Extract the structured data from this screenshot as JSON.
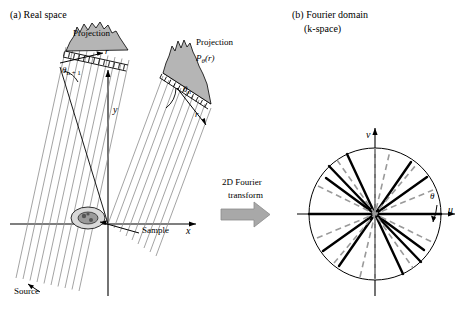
{
  "figure": {
    "panel_a": {
      "title": "(a) Real space",
      "labels": {
        "projection_left": "Projection",
        "projection_right": "Projection",
        "p_theta_r": "P",
        "p_theta_r_sub": "θ",
        "p_theta_r_tail": "(r)",
        "theta_n1": "θ",
        "theta_n1_sub": "n + 1",
        "theta_n": "θ",
        "theta_n_sub": "n",
        "r_left": "r",
        "r_right": "r",
        "axis_x": "x",
        "axis_y": "y",
        "sample": "Sample",
        "source": "Source"
      }
    },
    "panel_b": {
      "title_line1": "(b) Fourier domain",
      "title_line2": "(k-space)",
      "labels": {
        "axis_u": "u",
        "axis_v": "v",
        "theta": "θ"
      }
    },
    "center": {
      "arrow_label_line1": "2D Fourier",
      "arrow_label_line2": "transform"
    },
    "colors": {
      "stroke": "#000000",
      "fill_gray": "#b5b5b5",
      "line_gray": "#8c8c8c",
      "arrow_gray": "#a8a8a8",
      "dashed_gray": "#9a9a9a"
    }
  }
}
